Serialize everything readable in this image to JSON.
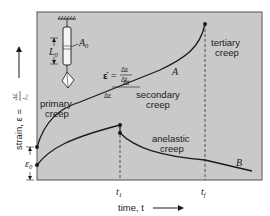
{
  "diagram": {
    "type": "creep-curve",
    "plot_background": "#c9c9c9",
    "line_color": "#1a1a1a",
    "y_axis_label": "strain, ε = ΔL/L₀",
    "y_axis_label_prefix": "strain, ε =",
    "y_axis_fraction_num": "ΔL",
    "y_axis_fraction_den": "L₀",
    "x_axis_label": "time, t",
    "x_ticks": [
      {
        "label": "t",
        "sub": "1"
      },
      {
        "label": "t",
        "sub": "f"
      }
    ],
    "epsilon0_label": "ε",
    "epsilon0_sub": "0",
    "specimen": {
      "length_label": "L",
      "length_sub": "0",
      "area_label": "A",
      "area_sub": "0"
    },
    "rate_equation": {
      "lhs": "ε̇",
      "equals": "=",
      "num": "Δε",
      "den": "Δt"
    },
    "slope_labels": {
      "delta_t": "Δt",
      "delta_eps": "Δε"
    },
    "region_labels": {
      "primary_line1": "primary",
      "primary_line2": "creep",
      "secondary_line1": "secondary",
      "secondary_line2": "creep",
      "tertiary_line1": "tertiary",
      "tertiary_line2": "creep",
      "anelastic_line1": "anelastic",
      "anelastic_line2": "creep"
    },
    "curve_labels": {
      "A": "A",
      "B": "B"
    }
  }
}
